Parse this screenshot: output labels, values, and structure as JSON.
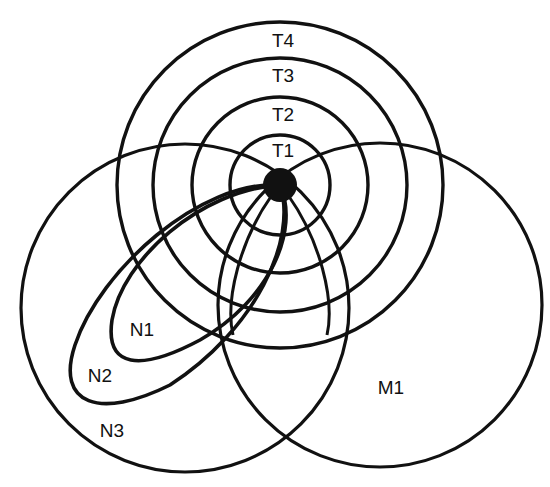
{
  "diagram": {
    "stroke_color": "#111111",
    "background": "#ffffff",
    "center_dot": {
      "cx": 280,
      "cy": 185,
      "r": 17
    },
    "concentric_circles": [
      {
        "id": "T1",
        "label": "T1",
        "cx": 280,
        "cy": 185,
        "r": 50,
        "label_x": 283,
        "label_y": 152
      },
      {
        "id": "T2",
        "label": "T2",
        "cx": 280,
        "cy": 185,
        "r": 88,
        "label_x": 283,
        "label_y": 116
      },
      {
        "id": "T3",
        "label": "T3",
        "cx": 280,
        "cy": 185,
        "r": 127,
        "label_x": 283,
        "label_y": 77
      },
      {
        "id": "T4",
        "label": "T4",
        "cx": 280,
        "cy": 185,
        "r": 163,
        "label_x": 283,
        "label_y": 42
      }
    ],
    "large_circles": [
      {
        "id": "N3",
        "label": "N3",
        "cx": 185,
        "cy": 308,
        "r": 164,
        "label_x": 112,
        "label_y": 432
      },
      {
        "id": "M1",
        "label": "M1",
        "cx": 380,
        "cy": 305,
        "r": 162,
        "label_x": 391,
        "label_y": 389
      }
    ],
    "ellipses": [
      {
        "id": "N1",
        "label": "N1",
        "label_x": 142,
        "label_y": 331,
        "path": "M 280 185 C 300 230, 270 300, 200 340 C 140 372, 105 368, 112 320 C 122 260, 200 190, 280 185 Z"
      },
      {
        "id": "N2",
        "label": "N2",
        "label_x": 100,
        "label_y": 377,
        "path": "M 280 185 C 298 240, 255 330, 170 385 C 100 420, 55 405, 75 345 C 100 270, 200 180, 280 185 Z"
      }
    ],
    "rays": [
      {
        "id": "ray-left-lens",
        "path": "M 272 195 C 240 240, 225 300, 233 335"
      },
      {
        "id": "ray-right-lens",
        "path": "M 288 195 C 320 240, 335 300, 327 335"
      }
    ],
    "lens_lower": {
      "id": "lower-lens-note",
      "description": "intersection of N3 and M1 circles"
    }
  }
}
